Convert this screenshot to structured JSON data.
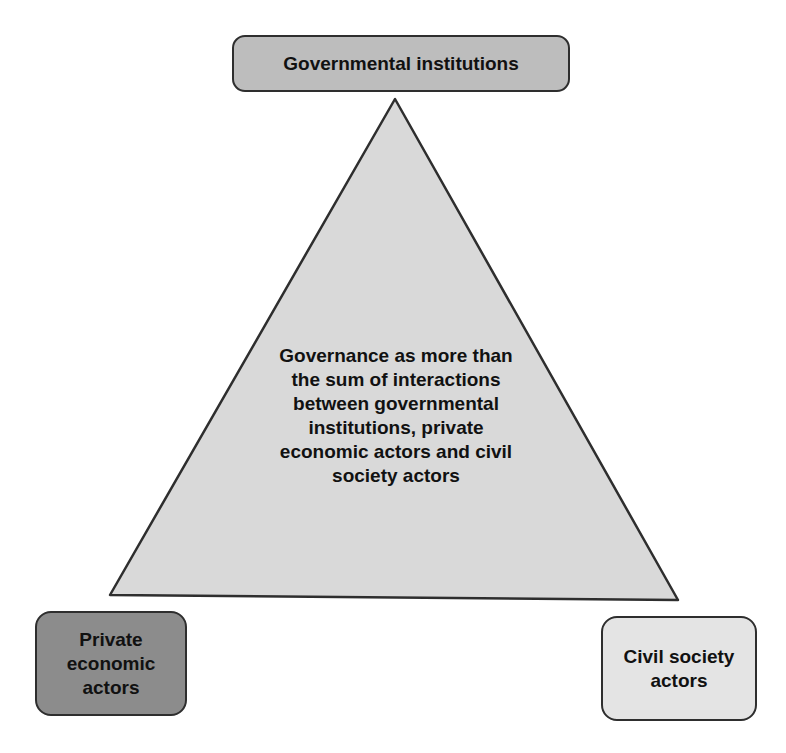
{
  "diagram": {
    "type": "governance-triangle",
    "nodes": {
      "top": {
        "label": "Governmental institutions",
        "fill": "#bdbdbd"
      },
      "bottom_left": {
        "label": "Private economic actors",
        "fill": "#8c8c8c"
      },
      "bottom_right": {
        "label": "Civil society actors",
        "fill": "#e4e4e4"
      }
    },
    "triangle": {
      "fill": "#d9d9d9",
      "stroke": "#2e2e2e",
      "center_label": "Governance as more than the sum of interactions between governmental institutions, private economic actors and civil society actors"
    }
  }
}
